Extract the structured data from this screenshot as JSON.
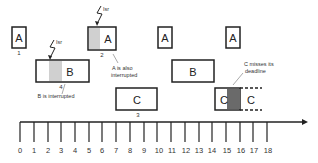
{
  "diagram": {
    "title": "",
    "timeline": {
      "ticks": [
        "0",
        "1",
        "2",
        "3",
        "4",
        "5",
        "6",
        "7",
        "8",
        "9",
        "10",
        "11",
        "12",
        "13",
        "14",
        "15",
        "16",
        "17",
        "18"
      ]
    },
    "tasks": [
      {
        "id": "a1",
        "label": "A",
        "order": "1"
      },
      {
        "id": "b1",
        "label": "B",
        "order": "4"
      },
      {
        "id": "a2",
        "label": "A",
        "order": "2"
      },
      {
        "id": "c1",
        "label": "C",
        "order": "3"
      },
      {
        "id": "a3",
        "label": "A",
        "order": ""
      },
      {
        "id": "b2",
        "label": "B",
        "order": ""
      },
      {
        "id": "a4",
        "label": "A",
        "order": ""
      },
      {
        "id": "c2a",
        "label": "C",
        "order": ""
      },
      {
        "id": "c2b",
        "label": "C",
        "order": ""
      }
    ],
    "interrupts": [
      {
        "label": "Isr"
      },
      {
        "label": "Isr"
      }
    ],
    "annotations": {
      "a_interrupted_1": "A is also",
      "a_interrupted_2": "interrupted",
      "b_interrupted": "B is interrupted",
      "c_miss_1": "C misses its",
      "c_miss_2": "deadline"
    },
    "colors": {
      "interrupt_shade": "#d0d0d0",
      "deadline_miss_shade": "#6a6a6a",
      "stroke": "#222222"
    }
  }
}
